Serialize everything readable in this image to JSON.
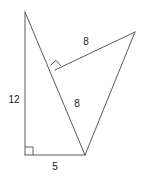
{
  "figure": {
    "background_color": "#ffffff",
    "stroke_color": "#5a5a5a",
    "label_color": "#1a1a1a",
    "width": 142,
    "height": 180,
    "points": {
      "apex_top": {
        "name": "top-apex",
        "x": 25,
        "y": 12
      },
      "corner_bottom_left": {
        "name": "bottom-left-corner",
        "x": 25,
        "y": 155
      },
      "vertex_bottom": {
        "name": "bottom-shared-vertex",
        "x": 85,
        "y": 155
      },
      "vertex_right": {
        "name": "right-apex",
        "x": 135,
        "y": 32
      },
      "vertex_mid": {
        "name": "mid-right-angle-vertex",
        "x": 55,
        "y": 70
      }
    },
    "edges": [
      {
        "name": "left-vertical-edge",
        "path": "M 25 12 L 25 155"
      },
      {
        "name": "bottom-horizontal-edge",
        "path": "M 25 155 L 85 155"
      },
      {
        "name": "transversal-edge",
        "path": "M 25 12 L 85 155"
      },
      {
        "name": "upper-slant-edge",
        "path": "M 55 70 L 135 32"
      },
      {
        "name": "right-long-edge",
        "path": "M 135 32 L 85 155"
      }
    ],
    "angle_markers": [
      {
        "name": "right-angle-bottom-left",
        "path": "M 25 147 L 33 147 L 33 155"
      },
      {
        "name": "right-angle-mid",
        "path": "M 50.7 65.1 L 56.1 60.4 L 60.8 65.8"
      }
    ],
    "labels": [
      {
        "name": "label-left-leg",
        "text": "12",
        "x": 14,
        "y": 100
      },
      {
        "name": "label-bottom-leg",
        "text": "5",
        "x": 55,
        "y": 167
      },
      {
        "name": "label-upper-slant",
        "text": "8",
        "x": 86,
        "y": 42
      },
      {
        "name": "label-transversal-lower",
        "text": "8",
        "x": 77,
        "y": 104
      }
    ]
  }
}
